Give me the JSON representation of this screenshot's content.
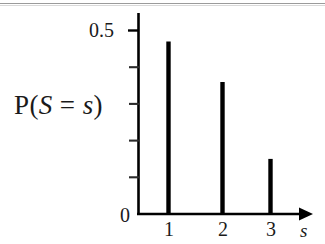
{
  "figure": {
    "kind": "probability-mass-function-plot",
    "background_color": "#ffffff",
    "ink_color": "#000000"
  },
  "chart_data": {
    "type": "bar",
    "title": "",
    "subtitle": "",
    "xlabel": "s",
    "ylabel": "P(S = s)",
    "ylabel_parts": {
      "p": "P(",
      "var_upper": "S",
      "equals": " = ",
      "var_lower": "s",
      "close": ")"
    },
    "categories": [
      "1",
      "2",
      "3"
    ],
    "values": [
      0.47,
      0.36,
      0.15
    ],
    "x": [
      1,
      2,
      3
    ],
    "xlim": [
      0.45,
      3.85
    ],
    "ylim": [
      0,
      0.555
    ],
    "xtick_labels": [
      "1",
      "2",
      "3"
    ],
    "ytick_labels": [
      "0",
      "0.5"
    ],
    "ytick_values": [
      0,
      0.5
    ],
    "y_minor_tick_values": [
      0.1,
      0.2,
      0.3,
      0.4
    ],
    "grid": false,
    "legend": null,
    "x_axis_arrow": true,
    "bar_style": "thin-vertical-spike",
    "bar_color": "#000000"
  },
  "annotations": {
    "scan_rule_visible": true
  }
}
